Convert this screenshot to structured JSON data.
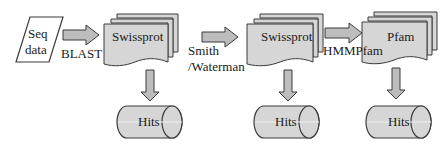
{
  "diagram": {
    "colors": {
      "fill": "#d6d6d6",
      "stroke": "#3a3a3a",
      "arrow_fill": "#bdbdbd",
      "background": "#ffffff"
    },
    "nodes": {
      "seq_data": {
        "label_line1": "Seq",
        "label_line2": "data",
        "shape": "parallelogram"
      },
      "swissprot_1": {
        "label": "Swissprot",
        "shape": "multi-document"
      },
      "swissprot_2": {
        "label": "Swissprot",
        "shape": "multi-document"
      },
      "pfam": {
        "label": "Pfam",
        "shape": "multi-document"
      },
      "hits_1": {
        "label": "Hits",
        "shape": "cylinder"
      },
      "hits_2": {
        "label": "Hits",
        "shape": "cylinder"
      },
      "hits_3": {
        "label": "Hits",
        "shape": "cylinder"
      }
    },
    "edges": [
      {
        "from": "seq_data",
        "to": "swissprot_1",
        "label": "BLAST"
      },
      {
        "from": "swissprot_1",
        "to": "swissprot_2",
        "label_line1": "Smith",
        "label_line2": "/Waterman"
      },
      {
        "from": "swissprot_2",
        "to": "pfam",
        "label": "HMMPfam"
      },
      {
        "from": "swissprot_1",
        "to": "hits_1",
        "label": ""
      },
      {
        "from": "swissprot_2",
        "to": "hits_2",
        "label": ""
      },
      {
        "from": "pfam",
        "to": "hits_3",
        "label": ""
      }
    ]
  }
}
